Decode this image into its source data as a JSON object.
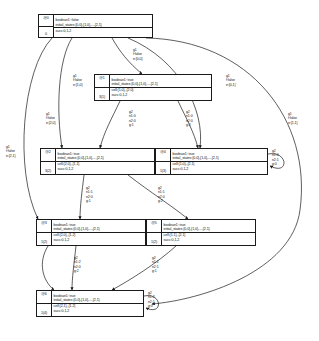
{
  "diagram": {
    "background": "#ffffff",
    "stroke": "#1a1a1a",
    "text_color": "#111111"
  },
  "nodes": [
    {
      "key": "n0",
      "id": "@0",
      "count": "0",
      "rows": [
        "boolean1: false",
        "initial_states:{0,0},{1,0},...,{2,1}",
        "succ:0,1,2"
      ],
      "x": 38,
      "y": 14,
      "w": 115,
      "h": 24
    },
    {
      "key": "n1",
      "id": "@1",
      "count": "3(1)",
      "rows": [
        "boolean1: true",
        "initial_states:{0,0},{1,0},...,{2,1}",
        "cell:{1,0},,{2,0}",
        "succ:0,1,2"
      ],
      "x": 94,
      "y": 74,
      "w": 118,
      "h": 27
    },
    {
      "key": "n2",
      "id": "@2",
      "count": "3(2)",
      "rows": [
        "boolean1: true",
        "initial_states:{0,0},{1,0},...,{2,1}",
        "cell:{2,0},,{1,1}",
        "succ:0,1,2"
      ],
      "x": 40,
      "y": 148,
      "w": 115,
      "h": 27
    },
    {
      "key": "n4",
      "id": "@4",
      "count": "1(3)",
      "rows": [
        "boolean1: true",
        "initial_states:{0,0},{1,0},...,{2,1}",
        "cell:{1,0},,{2,1}",
        "succ:0,1,2"
      ],
      "x": 155,
      "y": 148,
      "w": 113,
      "h": 27
    },
    {
      "key": "n3",
      "id": "@3",
      "count": "1(2)",
      "rows": [
        "boolean1: true",
        "initial_states:{0,0},{1,0},...,{2,1}",
        "cell:{2,0},,{1,2}",
        "succ:0,1,2"
      ],
      "x": 36,
      "y": 219,
      "w": 110,
      "h": 27
    },
    {
      "key": "n5",
      "id": "@5",
      "count": "1(2)",
      "rows": [
        "boolean1: true",
        "initial_states:{0,0},{1,0},...,{2,1}",
        "cell:{1,1},,{2,1}",
        "succ:0,1,2"
      ],
      "x": 146,
      "y": 219,
      "w": 110,
      "h": 27
    },
    {
      "key": "n6",
      "id": "@6",
      "count": "1(4)",
      "rows": [
        "boolean1: true",
        "initial_states:{0,0},{1,0},...,{2,1}",
        "cell:{2,1},,{1,2}",
        "succ:0,1,2"
      ],
      "x": 36,
      "y": 290,
      "w": 108,
      "h": 27
    }
  ],
  "edge_labels": [
    {
      "key": "l_g1_00",
      "lines": [
        "g1",
        "f:false",
        "e:{0,0}"
      ],
      "x": 133,
      "y": 48
    },
    {
      "key": "l_g1_10",
      "lines": [
        "g1",
        "f:false",
        "e:{1,0}"
      ],
      "x": 73,
      "y": 74
    },
    {
      "key": "l_g1_01",
      "lines": [
        "g1",
        "f:false",
        "e:{0,1}"
      ],
      "x": 226,
      "y": 74
    },
    {
      "key": "l_g1_20",
      "lines": [
        "g1",
        "f:false",
        "e:{2,0}"
      ],
      "x": 46,
      "y": 112
    },
    {
      "key": "l_g1_21",
      "lines": [
        "g1",
        "f:false",
        "e:{2,1}"
      ],
      "x": 6,
      "y": 145
    },
    {
      "key": "l_g1_11",
      "lines": [
        "g1",
        "f:false",
        "e:{1,1}"
      ],
      "x": 288,
      "y": 112
    },
    {
      "key": "l_g2_a",
      "lines": [
        "g2",
        "n1:0",
        "n2:0",
        "g:1"
      ],
      "x": 129,
      "y": 110
    },
    {
      "key": "l_g2_b",
      "lines": [
        "g2",
        "n1:0",
        "n2:0",
        "g:2"
      ],
      "x": 186,
      "y": 110
    },
    {
      "key": "l_g2_c",
      "lines": [
        "g2",
        "n1:1",
        "n2:0",
        "g:1"
      ],
      "x": 86,
      "y": 186
    },
    {
      "key": "l_g2_d",
      "lines": [
        "g2",
        "n1:1",
        "n2:0",
        "g:2"
      ],
      "x": 158,
      "y": 186
    },
    {
      "key": "l_g2_e",
      "lines": [
        "g2",
        "n1:2",
        "n2:0",
        "g:2"
      ],
      "x": 74,
      "y": 256
    },
    {
      "key": "l_g2_f",
      "lines": [
        "g2",
        "n1:1",
        "n2:1",
        "g:1"
      ],
      "x": 152,
      "y": 256
    },
    {
      "key": "l_g2_r4",
      "lines": [
        "g2",
        "n1:0",
        "n2:1",
        "g:0"
      ],
      "x": 272,
      "y": 149
    },
    {
      "key": "l_g2_r6",
      "lines": [
        "g2",
        "n1:2",
        "n2:1",
        "g:0"
      ],
      "x": 148,
      "y": 291
    }
  ],
  "edges": [
    {
      "from": "@0",
      "to": "@1",
      "label": "g1 f:false e:{0,0}"
    },
    {
      "from": "@0",
      "to": "@2",
      "label": "g1 f:false e:{2,0}"
    },
    {
      "from": "@0",
      "to": "@3",
      "label": "g1 f:false e:{2,1}"
    },
    {
      "from": "@0",
      "to": "@4",
      "label": "g1 f:false e:{0,1}"
    },
    {
      "from": "@0",
      "to": "@6",
      "label": "g1 f:false e:{1,1}"
    },
    {
      "from": "@1",
      "to": "@2",
      "label": "g2 n1:0 n2:0 g:1"
    },
    {
      "from": "@1",
      "to": "@4",
      "label": "g2 n1:0 n2:0 g:2"
    },
    {
      "from": "@2",
      "to": "@3",
      "label": "g2 n1:1 n2:0 g:1"
    },
    {
      "from": "@2",
      "to": "@5",
      "label": "g2 n1:1 n2:0 g:2"
    },
    {
      "from": "@3",
      "to": "@6",
      "label": "g2 n1:2 n2:0 g:2"
    },
    {
      "from": "@5",
      "to": "@6",
      "label": "g2 n1:1 n2:1 g:1"
    },
    {
      "from": "@4",
      "to": "@4",
      "label": "g2 n1:0 n2:1 g:0"
    },
    {
      "from": "@6",
      "to": "@6",
      "label": "g2 n1:2 n2:1 g:0"
    }
  ]
}
